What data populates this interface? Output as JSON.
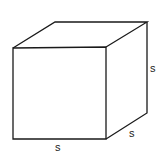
{
  "diagram": {
    "type": "cube",
    "stroke_color": "#1a1a1a",
    "background": "#ffffff",
    "labels": {
      "right_edge": "s",
      "depth_edge": "s",
      "bottom_edge": "s"
    }
  }
}
